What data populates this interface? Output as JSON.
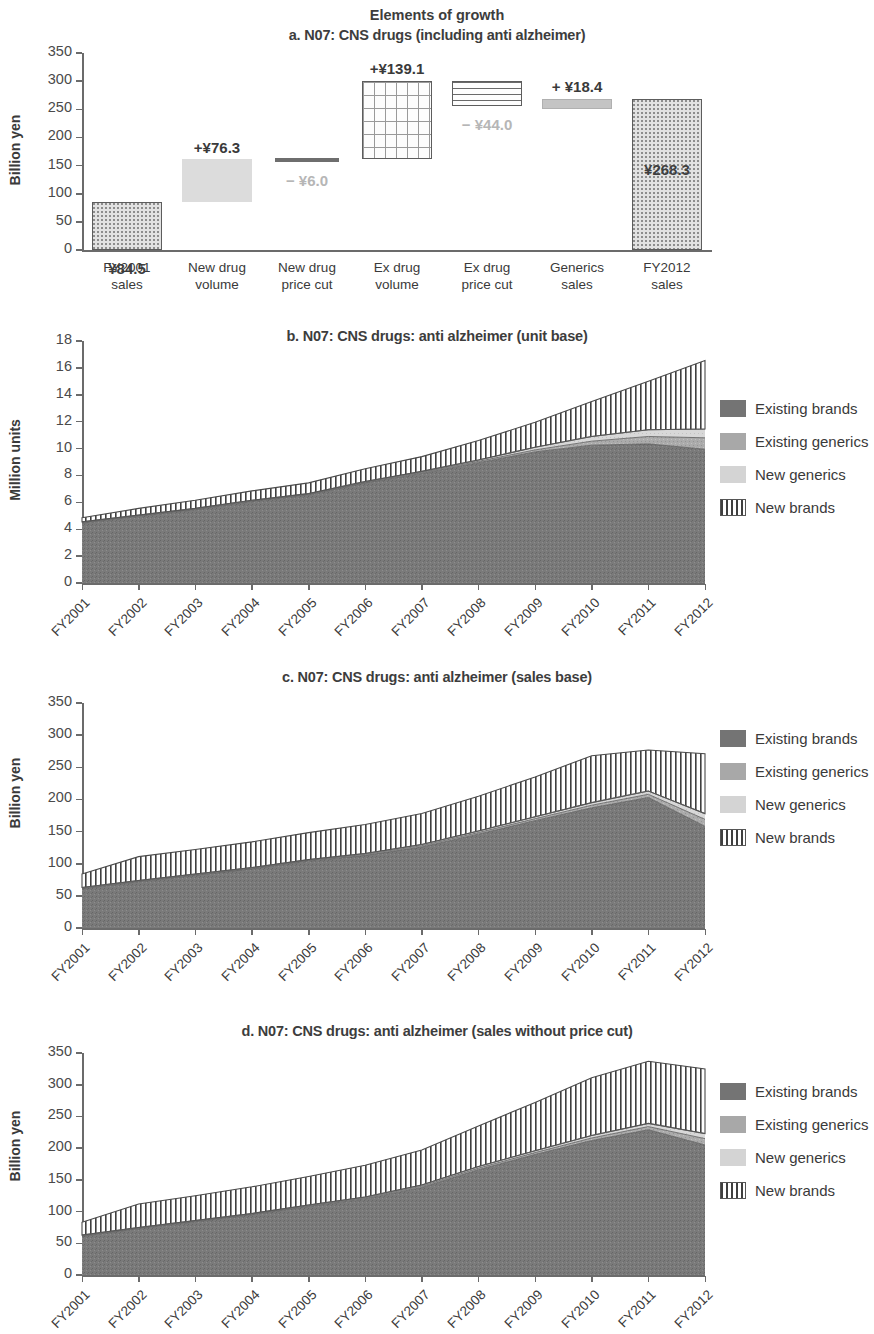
{
  "figure": {
    "suptitle": "Elements of growth"
  },
  "panel_a": {
    "title": "a. N07: CNS drugs (including anti alzheimer)",
    "ylabel": "Billion yen",
    "yticks": [
      "0",
      "50",
      "100",
      "150",
      "200",
      "250",
      "300",
      "350"
    ],
    "categories": [
      "FY2001\nsales",
      "New drug\nvolume",
      "New drug\nprice cut",
      "Ex drug\nvolume",
      "Ex drug\nprice cut",
      "Generics\nsales",
      "FY2012\nsales"
    ],
    "labels": {
      "c0": "¥84.5",
      "c1": "+¥76.3",
      "c2": "− ¥6.0",
      "c3": "+¥139.1",
      "c4": "− ¥44.0",
      "c5": "+ ¥18.4",
      "c6": "¥268.3"
    }
  },
  "panel_b": {
    "title": "b. N07: CNS drugs: anti alzheimer (unit base)",
    "ylabel": "Million units",
    "yticks": [
      "0",
      "2",
      "4",
      "6",
      "8",
      "10",
      "12",
      "14",
      "16",
      "18"
    ],
    "xticks": [
      "FY2001",
      "FY2002",
      "FY2003",
      "FY2004",
      "FY2005",
      "FY2006",
      "FY2007",
      "FY2008",
      "FY2009",
      "FY2010",
      "FY2011",
      "FY2012"
    ],
    "legend": [
      "Existing brands",
      "Existing generics",
      "New generics",
      "New brands"
    ]
  },
  "panel_c": {
    "title": "c. N07: CNS drugs: anti alzheimer (sales base)",
    "ylabel": "Billion yen",
    "yticks": [
      "0",
      "50",
      "100",
      "150",
      "200",
      "250",
      "300",
      "350"
    ],
    "xticks": [
      "FY2001",
      "FY2002",
      "FY2003",
      "FY2004",
      "FY2005",
      "FY2006",
      "FY2007",
      "FY2008",
      "FY2009",
      "FY2010",
      "FY2011",
      "FY2012"
    ],
    "legend": [
      "Existing brands",
      "Existing generics",
      "New generics",
      "New brands"
    ]
  },
  "panel_d": {
    "title": "d. N07: CNS drugs: anti alzheimer (sales without price cut)",
    "ylabel": "Billion yen",
    "yticks": [
      "0",
      "50",
      "100",
      "150",
      "200",
      "250",
      "300",
      "350"
    ],
    "xticks": [
      "FY2001",
      "FY2002",
      "FY2003",
      "FY2004",
      "FY2005",
      "FY2006",
      "FY2007",
      "FY2008",
      "FY2009",
      "FY2010",
      "FY2011",
      "FY2012"
    ],
    "legend": [
      "Existing brands",
      "Existing generics",
      "New generics",
      "New brands"
    ]
  },
  "colors": {
    "existing_brands": "#747474",
    "existing_generics": "#a8a8a8",
    "new_generics": "#d4d4d4",
    "new_brands": "#ffffff",
    "axis": "#6b6b6b",
    "text": "#3a3a3a",
    "faint_label": "#b6b6b6"
  },
  "chart_data": [
    {
      "id": "a",
      "type": "bar",
      "subtype": "waterfall",
      "title": "a. N07: CNS drugs (including anti alzheimer)",
      "xlabel": "",
      "ylabel": "Billion yen",
      "ylim": [
        0,
        350
      ],
      "ytick_step": 50,
      "grid": false,
      "legend": "none",
      "categories": [
        "FY2001 sales",
        "New drug volume",
        "New drug price cut",
        "Ex drug volume",
        "Ex drug price cut",
        "Generics sales",
        "FY2012 sales"
      ],
      "deltas": [
        84.5,
        76.3,
        -6.0,
        139.1,
        -44.0,
        18.4,
        268.3
      ],
      "kinds": [
        "total",
        "increase",
        "decrease",
        "increase",
        "decrease",
        "increase",
        "total"
      ],
      "bar_bases": [
        0.0,
        84.5,
        154.8,
        160.8,
        255.9,
        249.9,
        0.0
      ],
      "bar_tops": [
        84.5,
        160.8,
        160.8,
        299.9,
        299.9,
        268.3,
        268.3
      ],
      "data_labels": [
        "¥84.5",
        "+¥76.3",
        "− ¥6.0",
        "+¥139.1",
        "− ¥44.0",
        "+ ¥18.4",
        "¥268.3"
      ],
      "fills": [
        "dotted",
        "solid-light",
        "dark-line",
        "grid-hatch",
        "horizontal-lines",
        "gray-solid",
        "dotted"
      ]
    },
    {
      "id": "b",
      "type": "area",
      "subtype": "stacked-area",
      "title": "b. N07: CNS drugs: anti alzheimer (unit base)",
      "xlabel": "",
      "ylabel": "Million units",
      "ylim": [
        0,
        18
      ],
      "ytick_step": 2,
      "grid": false,
      "legend_position": "right",
      "x": [
        "FY2001",
        "FY2002",
        "FY2003",
        "FY2004",
        "FY2005",
        "FY2006",
        "FY2007",
        "FY2008",
        "FY2009",
        "FY2010",
        "FY2011",
        "FY2012"
      ],
      "series": [
        {
          "name": "Existing brands",
          "values": [
            4.45,
            4.95,
            5.45,
            6.05,
            6.55,
            7.45,
            8.15,
            8.95,
            9.75,
            10.25,
            10.35,
            9.95
          ]
        },
        {
          "name": "Existing generics",
          "values": [
            0.05,
            0.05,
            0.05,
            0.05,
            0.05,
            0.05,
            0.08,
            0.1,
            0.15,
            0.3,
            0.55,
            0.85
          ]
        },
        {
          "name": "New generics",
          "values": [
            0.05,
            0.05,
            0.05,
            0.05,
            0.05,
            0.05,
            0.07,
            0.1,
            0.2,
            0.35,
            0.5,
            0.65
          ]
        },
        {
          "name": "New brands",
          "values": [
            0.3,
            0.5,
            0.6,
            0.7,
            0.8,
            0.95,
            1.1,
            1.45,
            1.85,
            2.6,
            3.6,
            5.1
          ]
        }
      ],
      "totals": [
        4.85,
        5.55,
        6.15,
        6.85,
        7.45,
        8.5,
        9.4,
        10.6,
        11.95,
        13.5,
        15.0,
        16.55
      ]
    },
    {
      "id": "c",
      "type": "area",
      "subtype": "stacked-area",
      "title": "c. N07: CNS drugs: anti alzheimer (sales base)",
      "xlabel": "",
      "ylabel": "Billion yen",
      "ylim": [
        0,
        350
      ],
      "ytick_step": 50,
      "grid": false,
      "legend_position": "right",
      "x": [
        "FY2001",
        "FY2002",
        "FY2003",
        "FY2004",
        "FY2005",
        "FY2006",
        "FY2007",
        "FY2008",
        "FY2009",
        "FY2010",
        "FY2011",
        "FY2012"
      ],
      "series": [
        {
          "name": "Existing brands",
          "values": [
            61,
            72,
            82,
            92,
            104,
            113,
            126,
            146,
            167,
            187,
            203,
            158
          ]
        },
        {
          "name": "Existing generics",
          "values": [
            1.0,
            1.0,
            1.0,
            1.0,
            1.2,
            1.5,
            2.0,
            2.5,
            3.0,
            4.0,
            5.0,
            11.0
          ]
        },
        {
          "name": "New generics",
          "values": [
            1.0,
            1.0,
            1.0,
            1.0,
            1.2,
            1.5,
            2.0,
            2.5,
            3.0,
            4.0,
            5.0,
            9.0
          ]
        },
        {
          "name": "New brands",
          "values": [
            21,
            37,
            38,
            40,
            42,
            45,
            48,
            54,
            62,
            73,
            64,
            93
          ]
        }
      ],
      "totals": [
        84,
        111,
        122,
        134,
        148,
        161,
        178,
        205,
        235,
        268,
        277,
        271
      ]
    },
    {
      "id": "d",
      "type": "area",
      "subtype": "stacked-area",
      "title": "d. N07: CNS drugs: anti alzheimer (sales without price cut)",
      "xlabel": "",
      "ylabel": "Billion yen",
      "ylim": [
        0,
        350
      ],
      "ytick_step": 50,
      "grid": false,
      "legend_position": "right",
      "x": [
        "FY2001",
        "FY2002",
        "FY2003",
        "FY2004",
        "FY2005",
        "FY2006",
        "FY2007",
        "FY2008",
        "FY2009",
        "FY2010",
        "FY2011",
        "FY2012"
      ],
      "series": [
        {
          "name": "Existing brands",
          "values": [
            61,
            73,
            84,
            95,
            108,
            120,
            138,
            166,
            190,
            212,
            229,
            205
          ]
        },
        {
          "name": "Existing generics",
          "values": [
            1.0,
            1.0,
            1.0,
            1.0,
            1.2,
            1.5,
            2.0,
            2.5,
            3.0,
            4.0,
            5.0,
            10.0
          ]
        },
        {
          "name": "New generics",
          "values": [
            1.0,
            1.0,
            1.0,
            1.0,
            1.2,
            1.5,
            2.0,
            2.5,
            3.0,
            4.0,
            5.0,
            8.0
          ]
        },
        {
          "name": "New brands",
          "values": [
            20,
            37,
            39,
            42,
            45,
            50,
            55,
            64,
            76,
            91,
            98,
            102
          ]
        }
      ],
      "totals": [
        83,
        112,
        125,
        139,
        155,
        173,
        197,
        235,
        272,
        311,
        337,
        325
      ]
    }
  ]
}
